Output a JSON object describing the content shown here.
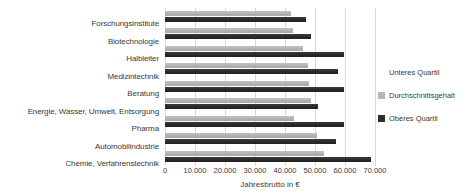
{
  "chart_data": {
    "type": "bar",
    "orientation": "horizontal",
    "title": "",
    "xlabel": "Jahresbrutto in €",
    "ylabel": "",
    "xlim": [
      0,
      70000
    ],
    "xticks": [
      0,
      10000,
      20000,
      30000,
      40000,
      50000,
      60000,
      70000
    ],
    "xtick_labels": [
      "0",
      "10.000",
      "20.000",
      "30.000",
      "40.000",
      "50.000",
      "60.000",
      "70.000"
    ],
    "grid": true,
    "legend_position": "right",
    "categories": [
      "Forschungsinstitute",
      "Biotechnologie",
      "Halbleiter",
      "Medizintechnik",
      "Beratung",
      "Energie, Wasser, Umwelt, Entsorgung",
      "Pharma",
      "Automobilindustrie",
      "Chemie, Verfahrenstechnik"
    ],
    "series": [
      {
        "name": "Unteres Quartil",
        "color": "#ffffff",
        "values": [
          null,
          null,
          null,
          null,
          null,
          null,
          null,
          null,
          null
        ]
      },
      {
        "name": "Durchschnittsgehalt",
        "color": "#b6b6b6",
        "values": [
          42000,
          42500,
          46000,
          47500,
          48000,
          48500,
          43000,
          50500,
          53000
        ]
      },
      {
        "name": "Oberes Quartil",
        "color": "#2e2e2e",
        "values": [
          47000,
          48500,
          59500,
          57500,
          59500,
          51000,
          59500,
          57000,
          68500
        ]
      }
    ]
  },
  "legend": {
    "items": [
      {
        "label": "Unteres Quartil",
        "color": "#ffffff"
      },
      {
        "label": "Durchschnittsgehalt",
        "color": "#b6b6b6"
      },
      {
        "label": "Oberes Quartil",
        "color": "#2e2e2e"
      }
    ]
  }
}
